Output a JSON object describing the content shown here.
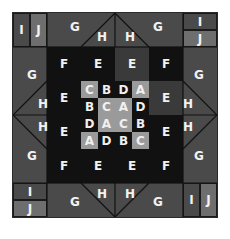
{
  "puzzle": {
    "outer": {
      "top_left": {
        "left": "I",
        "right": "J"
      },
      "top_right": {
        "top": "I",
        "bottom": "J"
      },
      "bottom_left": {
        "top": "I",
        "bottom": "J"
      },
      "bottom_right": {
        "left": "I",
        "right": "J"
      },
      "g_label": "G",
      "h_label": "H"
    },
    "ring": {
      "corner": "F",
      "edge": "E"
    },
    "center_grid": [
      [
        "C",
        "B",
        "D",
        "A"
      ],
      [
        "B",
        "C",
        "A",
        "D"
      ],
      [
        "D",
        "A",
        "C",
        "B"
      ],
      [
        "A",
        "D",
        "B",
        "C"
      ]
    ],
    "colors": {
      "outer": "#4c4c4c",
      "j_cell": "#6e6e6e",
      "dark": "#111111",
      "highlight": "#9a9a9a"
    }
  }
}
